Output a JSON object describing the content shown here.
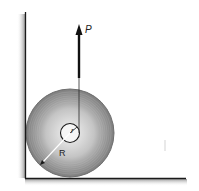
{
  "figure": {
    "labels": {
      "force": "P",
      "inner_radius": "r",
      "outer_radius": "R"
    },
    "elements": {
      "wall": "vertical wall",
      "floor": "horizontal floor",
      "spool": "spool / wheel with hub",
      "force_arrow": "upward force P"
    },
    "colors": {
      "outer_ring": "#8a8a8a",
      "inner_disk": "#c8c8c8",
      "center_glow": "#f2f2f2",
      "lines": "#1a1a1a",
      "shadow": "#bdbdbd"
    }
  }
}
